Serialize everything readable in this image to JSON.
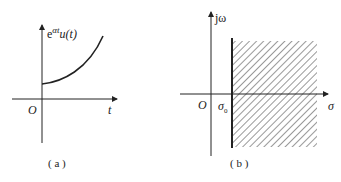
{
  "panels": [
    {
      "id": "a",
      "caption": "( a )",
      "y_axis_label_base": "e",
      "y_axis_label_exp": "αt",
      "y_axis_label_fn": "u(t)",
      "x_axis_label": "t",
      "origin_label": "O",
      "curve": "exponentially increasing function starting above origin at t=0"
    },
    {
      "id": "b",
      "caption": "( b )",
      "y_axis_label": "jω",
      "x_axis_label": "σ",
      "origin_label": "O",
      "boundary_label": "σ",
      "boundary_subscript": "0",
      "region": "hatched region of convergence Re(s) > σ0"
    }
  ],
  "colors": {
    "stroke": "#222222",
    "background": "#ffffff"
  }
}
